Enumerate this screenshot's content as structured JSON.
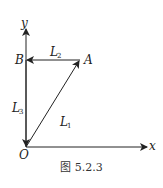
{
  "diagram": {
    "axes": {
      "x_label": "x",
      "y_label": "y"
    },
    "points": {
      "origin": "O",
      "A": "A",
      "B": "B"
    },
    "vectors": [
      {
        "name": "L",
        "sub": "1",
        "from": "O",
        "to": "A"
      },
      {
        "name": "L",
        "sub": "2",
        "from": "A",
        "to": "B"
      },
      {
        "name": "L",
        "sub": "3",
        "from": "B",
        "to": "O"
      }
    ],
    "caption": "图 5.2.3",
    "colors": {
      "stroke": "#222222",
      "background": "#ffffff"
    }
  }
}
